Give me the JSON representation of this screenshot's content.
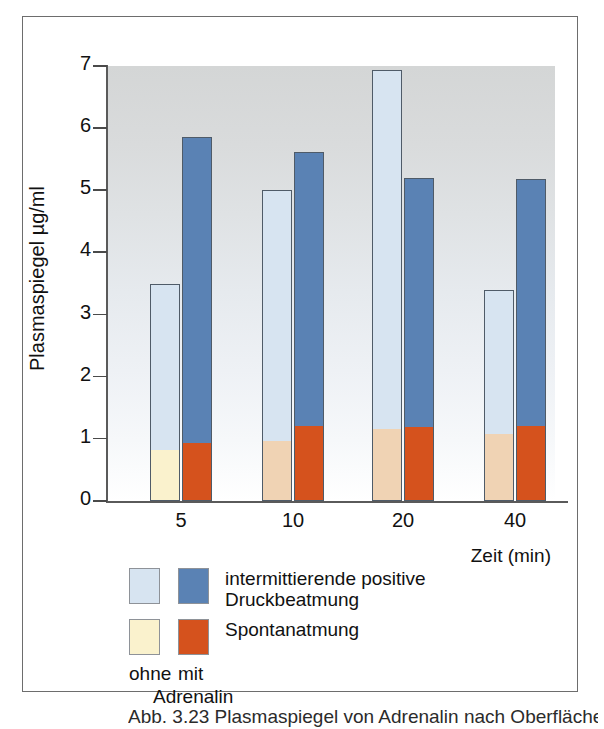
{
  "figure": {
    "caption_partial": "Abb. 3.23 Plasmaspiegel von Adrenalin nach Oberflächenanästhesie"
  },
  "chart_data": {
    "type": "bar",
    "subtype": "grouped-stacked",
    "title": "",
    "xlabel": "Zeit (min)",
    "ylabel": "Plasmaspiegel µg/ml",
    "categories": [
      "5",
      "10",
      "20",
      "40"
    ],
    "ylim": [
      0,
      7
    ],
    "yticks": [
      0,
      1,
      2,
      3,
      4,
      5,
      6,
      7
    ],
    "ytick_labels": [
      "0",
      "1",
      "2",
      "3",
      "4",
      "5",
      "6",
      "7"
    ],
    "grid": false,
    "legend_position": "below-plot",
    "series": [
      {
        "name": "intermittierende positive Druckbeatmung",
        "adrenalin": "ohne",
        "color": "#d7e4f1",
        "values": [
          3.5,
          5.0,
          6.94,
          3.39
        ]
      },
      {
        "name": "intermittierende positive Druckbeatmung",
        "adrenalin": "mit",
        "color": "#5a82b4",
        "values": [
          5.86,
          5.62,
          5.19,
          5.18
        ]
      },
      {
        "name": "Spontanatmung",
        "adrenalin": "ohne",
        "color": "#faf2cd",
        "values": [
          0.8,
          0.95,
          1.15,
          1.07
        ]
      },
      {
        "name": "Spontanatmung",
        "adrenalin": "mit",
        "color": "#d5521d",
        "values": [
          0.91,
          1.19,
          1.17,
          1.19
        ]
      }
    ],
    "bars": [
      {
        "category": "5",
        "ohne": {
          "bottom_value": 0.8,
          "bottom_color": "#faf2cd",
          "top_value": 3.5,
          "top_color": "#d7e4f1"
        },
        "mit": {
          "bottom_value": 0.91,
          "bottom_color": "#d5521d",
          "top_value": 5.86,
          "top_color": "#5a82b4"
        }
      },
      {
        "category": "10",
        "ohne": {
          "bottom_value": 0.95,
          "bottom_color": "#f0d3b4",
          "top_value": 5.0,
          "top_color": "#d7e4f1"
        },
        "mit": {
          "bottom_value": 1.19,
          "bottom_color": "#d5521d",
          "top_value": 5.62,
          "top_color": "#5a82b4"
        }
      },
      {
        "category": "20",
        "ohne": {
          "bottom_value": 1.15,
          "bottom_color": "#f0d3b4",
          "top_value": 6.94,
          "top_color": "#d7e4f1"
        },
        "mit": {
          "bottom_value": 1.17,
          "bottom_color": "#d5521d",
          "top_value": 5.19,
          "top_color": "#5a82b4"
        }
      },
      {
        "category": "40",
        "ohne": {
          "bottom_value": 1.07,
          "bottom_color": "#f0d3b4",
          "top_value": 3.39,
          "top_color": "#d7e4f1"
        },
        "mit": {
          "bottom_value": 1.19,
          "bottom_color": "#d5521d",
          "top_value": 5.18,
          "top_color": "#5a82b4"
        }
      }
    ]
  },
  "legend": {
    "rows": [
      {
        "swatch_ohne_color": "#d7e4f1",
        "swatch_mit_color": "#5a82b4",
        "label": "intermittierende positive Druckbeatmung"
      },
      {
        "swatch_ohne_color": "#faf2cd",
        "swatch_mit_color": "#d5521d",
        "label": "Spontanatmung"
      }
    ],
    "sub_ohne": "ohne",
    "sub_mit": "mit",
    "sub_group": "Adrenalin"
  },
  "colors": {
    "light_blue": "#d7e4f1",
    "blue": "#5a82b4",
    "cream": "#faf2cd",
    "salmon": "#f0d3b4",
    "orange": "#d5521d",
    "axis": "#5a5a5a",
    "frame": "#6d6d6d"
  }
}
